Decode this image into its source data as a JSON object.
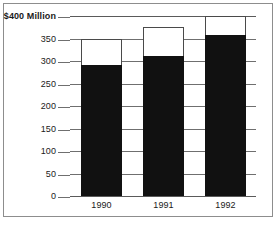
{
  "chart_data": {
    "type": "bar",
    "title": "",
    "subtitle": "",
    "xlabel": "",
    "ylabel": "",
    "axis_top_label": "$400 Million",
    "categories": [
      "1990",
      "1991",
      "1992"
    ],
    "ylim": [
      0,
      400
    ],
    "grid": true,
    "legend": "none",
    "stacked": true,
    "series": [
      {
        "name": "filled",
        "color": "#111111",
        "values": [
          292,
          312,
          357
        ]
      },
      {
        "name": "outline",
        "color": "#ffffff",
        "values": [
          350,
          375,
          400
        ]
      }
    ],
    "yticks": [
      {
        "value": 400,
        "label": "$400 Million"
      },
      {
        "value": 350,
        "label": "350"
      },
      {
        "value": 300,
        "label": "300"
      },
      {
        "value": 250,
        "label": "250"
      },
      {
        "value": 200,
        "label": "200"
      },
      {
        "value": 150,
        "label": "150"
      },
      {
        "value": 100,
        "label": "100"
      },
      {
        "value": 50,
        "label": "50"
      },
      {
        "value": 0,
        "label": "0"
      }
    ],
    "bars": [
      {
        "category": "1990",
        "filled_top": 292,
        "outline_top": 350
      },
      {
        "category": "1991",
        "filled_top": 312,
        "outline_top": 375
      },
      {
        "category": "1992",
        "filled_top": 357,
        "outline_top": 400
      }
    ]
  },
  "style": {
    "bar_fill_color": "#111111",
    "bar_outline_color": "#4a4a4a",
    "gridline_color": "#6f6f6f",
    "frame_color": "#8d8d8d",
    "background": "#ffffff",
    "text_color": "#1a1a1a"
  }
}
